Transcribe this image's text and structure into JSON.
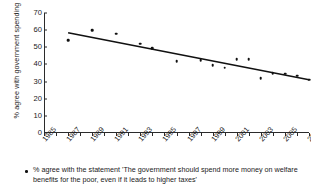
{
  "chart_data": {
    "type": "scatter",
    "title": "",
    "xlabel": "",
    "ylabel": "% agree with government spending",
    "xlim": [
      1985,
      2007
    ],
    "ylim": [
      0,
      70
    ],
    "ytick_labels": [
      "0",
      "10",
      "20",
      "30",
      "40",
      "50",
      "60",
      "70"
    ],
    "ytick_values": [
      0,
      10,
      20,
      30,
      40,
      50,
      60,
      70
    ],
    "xtick_labels": [
      "1985",
      "1987",
      "1989",
      "1991",
      "1993",
      "1995",
      "1997",
      "1999",
      "2001",
      "2003",
      "2005",
      "2007"
    ],
    "xtick_values": [
      1985,
      1987,
      1989,
      1991,
      1993,
      1995,
      1997,
      1999,
      2001,
      2003,
      2005,
      2007
    ],
    "grid": false,
    "legend_position": "below",
    "series": [
      {
        "name": "% agree with the statement 'The government should spend more money on welfare benefits for the poor, even if it leads to higher taxes'",
        "marker": "dot",
        "x": [
          1987,
          1989,
          1991,
          1993,
          1994,
          1996,
          1998,
          1999,
          2000,
          2001,
          2002,
          2003,
          2004,
          2005,
          2006,
          2007
        ],
        "values": [
          54,
          60,
          58,
          52,
          49.5,
          42,
          42.5,
          39.5,
          38,
          43,
          43,
          32,
          35,
          34.5,
          33.5,
          31
        ]
      }
    ],
    "trendline": {
      "type": "linear",
      "x_start": 1987,
      "y_start": 58.5,
      "x_end": 2007,
      "y_end": 31
    },
    "caption": "% agree with the statement 'The government should spend more money on welfare benefits for the poor, even if it leads to higher taxes'"
  },
  "colors": {
    "axis": "#2b2b2b",
    "marker": "#111111",
    "trendline": "#111111",
    "text": "#1a1a1a",
    "background": "#ffffff"
  }
}
